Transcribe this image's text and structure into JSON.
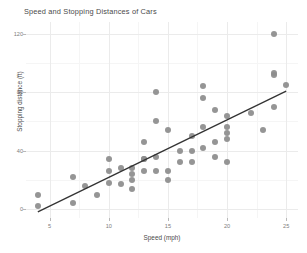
{
  "chart_data": {
    "type": "scatter",
    "title": "Speed and Stopping Distances of Cars",
    "xlabel": "Speed (mph)",
    "ylabel": "Stopping distance (ft)",
    "xlim": [
      3.0,
      26.0
    ],
    "ylim": [
      -6.0,
      128.0
    ],
    "grid": true,
    "legend": null,
    "x_ticks": [
      5,
      10,
      15,
      20,
      25
    ],
    "y_ticks": [
      0,
      40,
      80,
      120
    ],
    "x_tick_labels": [
      "5",
      "10",
      "15",
      "20",
      "25"
    ],
    "y_tick_labels": [
      "0",
      "40",
      "80",
      "120"
    ],
    "x_minor_ticks": [
      7.5,
      12.5,
      17.5,
      22.5
    ],
    "y_minor_ticks": [
      20,
      60,
      100
    ],
    "point_color": "#8c8c8c",
    "line_color": "#333333",
    "panel_background": "#ffffff",
    "grid_color_major": "#ebebeb",
    "grid_color_minor": "#f5f5f5",
    "series": [
      {
        "name": "cars",
        "marker": "circle",
        "x": [
          4,
          4,
          7,
          7,
          8,
          9,
          10,
          10,
          10,
          11,
          11,
          12,
          12,
          12,
          12,
          13,
          13,
          13,
          13,
          14,
          14,
          14,
          14,
          15,
          15,
          15,
          16,
          16,
          17,
          17,
          17,
          18,
          18,
          18,
          18,
          19,
          19,
          19,
          20,
          20,
          20,
          20,
          20,
          22,
          23,
          24,
          24,
          24,
          24,
          25
        ],
        "y": [
          2,
          10,
          4,
          22,
          16,
          10,
          18,
          26,
          34,
          17,
          28,
          14,
          20,
          24,
          28,
          26,
          34,
          34,
          46,
          26,
          36,
          60,
          80,
          20,
          26,
          54,
          32,
          40,
          32,
          40,
          50,
          42,
          56,
          76,
          84,
          36,
          46,
          68,
          32,
          48,
          52,
          56,
          64,
          66,
          54,
          70,
          92,
          93,
          120,
          85
        ]
      }
    ],
    "fit_line": {
      "type": "linear",
      "slope": 3.9324,
      "intercept": -17.5791,
      "x_start": 4,
      "x_end": 25,
      "y_start": -1.849,
      "y_end": 80.731
    }
  }
}
